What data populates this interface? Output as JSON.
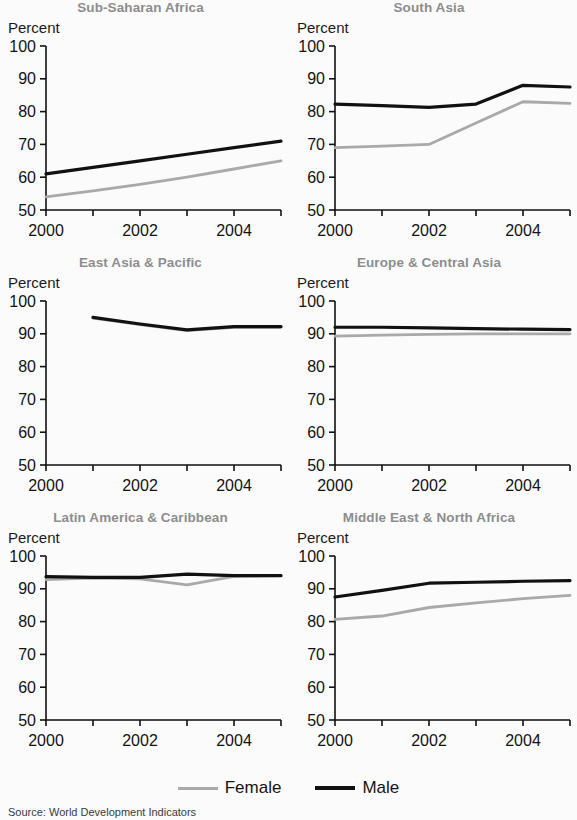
{
  "figure": {
    "y_axis_label": "Percent",
    "source_note": "Source: World Development Indicators",
    "legend": [
      {
        "key": "female",
        "label": "Female",
        "color": "#a9a9a9"
      },
      {
        "key": "male",
        "label": "Male",
        "color": "#111111"
      }
    ]
  },
  "chart_data": {
    "type": "line",
    "title": "",
    "xlabel": "",
    "ylabel": "Percent",
    "ylim": [
      50,
      100
    ],
    "yticks": [
      50,
      60,
      70,
      80,
      90,
      100
    ],
    "xlim": [
      2000,
      2005
    ],
    "xticks": [
      2000,
      2001,
      2002,
      2003,
      2004,
      2005
    ],
    "xticklabels": [
      "2000",
      "",
      "2002",
      "",
      "2004",
      ""
    ],
    "grid": false,
    "legend_position": "bottom-center",
    "panels": [
      {
        "title": "Sub-Saharan Africa",
        "x": [
          2000,
          2001,
          2002,
          2003,
          2004,
          2005
        ],
        "series": [
          {
            "name": "Female",
            "color": "#a9a9a9",
            "values": [
              54.0,
              55.8,
              57.8,
              60.0,
              62.5,
              65.0
            ]
          },
          {
            "name": "Male",
            "color": "#111111",
            "values": [
              61.0,
              63.0,
              65.0,
              67.0,
              69.0,
              71.0
            ]
          }
        ]
      },
      {
        "title": "South Asia",
        "x": [
          2000,
          2001,
          2002,
          2003,
          2004,
          2005
        ],
        "series": [
          {
            "name": "Female",
            "color": "#a9a9a9",
            "values": [
              69.0,
              69.5,
              70.0,
              76.5,
              83.0,
              82.5
            ]
          },
          {
            "name": "Male",
            "color": "#111111",
            "values": [
              82.3,
              81.8,
              81.3,
              82.3,
              88.0,
              87.5
            ]
          }
        ]
      },
      {
        "title": "East Asia & Pacific",
        "x": [
          2000,
          2001,
          2002,
          2003,
          2004,
          2005
        ],
        "series": [
          {
            "name": "Female",
            "color": "#a9a9a9",
            "values": [
              null,
              94.8,
              92.8,
              91.0,
              92.0,
              92.0
            ]
          },
          {
            "name": "Male",
            "color": "#111111",
            "values": [
              null,
              95.0,
              93.0,
              91.2,
              92.2,
              92.2
            ]
          }
        ]
      },
      {
        "title": "Europe & Central Asia",
        "x": [
          2000,
          2001,
          2002,
          2003,
          2004,
          2005
        ],
        "series": [
          {
            "name": "Female",
            "color": "#a9a9a9",
            "values": [
              89.3,
              89.6,
              89.8,
              90.0,
              90.0,
              90.0
            ]
          },
          {
            "name": "Male",
            "color": "#111111",
            "values": [
              92.0,
              92.0,
              91.8,
              91.6,
              91.4,
              91.3
            ]
          }
        ]
      },
      {
        "title": "Latin America & Caribbean",
        "x": [
          2000,
          2001,
          2002,
          2003,
          2004,
          2005
        ],
        "series": [
          {
            "name": "Female",
            "color": "#a9a9a9",
            "values": [
              92.8,
              93.3,
              93.0,
              91.2,
              93.8,
              94.0
            ]
          },
          {
            "name": "Male",
            "color": "#111111",
            "values": [
              93.7,
              93.5,
              93.5,
              94.5,
              94.0,
              94.0
            ]
          }
        ]
      },
      {
        "title": "Middle East & North Africa",
        "x": [
          2000,
          2001,
          2002,
          2003,
          2004,
          2005
        ],
        "series": [
          {
            "name": "Female",
            "color": "#a9a9a9",
            "values": [
              80.7,
              81.7,
              84.3,
              85.7,
              87.0,
              88.0
            ]
          },
          {
            "name": "Male",
            "color": "#111111",
            "values": [
              87.5,
              89.5,
              91.7,
              92.0,
              92.3,
              92.5
            ]
          }
        ]
      }
    ]
  }
}
